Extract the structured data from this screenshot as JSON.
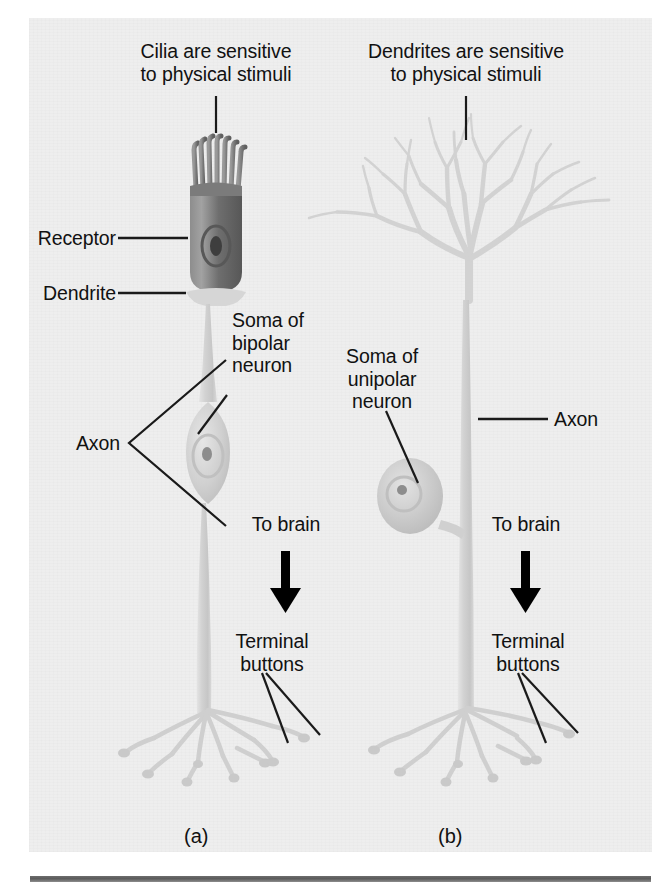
{
  "figure": {
    "background_color": "#eeeeee",
    "page_color": "#ffffff",
    "rule_color": "#5b5b5b"
  },
  "panel_a": {
    "caption": "(a)",
    "labels": {
      "top_note": "Cilia are sensitive\nto physical stimuli",
      "receptor": "Receptor",
      "dendrite": "Dendrite",
      "soma": "Soma of\nbipolar\nneuron",
      "axon": "Axon",
      "to_brain": "To brain",
      "terminal_buttons": "Terminal\nbuttons"
    }
  },
  "panel_b": {
    "caption": "(b)",
    "labels": {
      "top_note": "Dendrites are sensitive\nto physical stimuli",
      "soma": "Soma of\nunipolar\nneuron",
      "axon": "Axon",
      "to_brain": "To brain",
      "terminal_buttons": "Terminal\nbuttons"
    }
  },
  "colors": {
    "receptor_body": "#6f6f6f",
    "neuron_pale": "#d8d8d8",
    "leader_line": "#1a1a1a",
    "arrow": "#000000"
  }
}
